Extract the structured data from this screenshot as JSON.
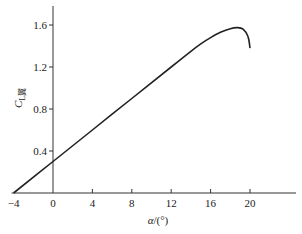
{
  "chart_data": {
    "type": "line",
    "title": "",
    "xlabel": "α/(°)",
    "ylabel": "C_L翼",
    "ylabel_parts": {
      "main": "C",
      "sub": "L翼"
    },
    "xlabel_parts": {
      "main": "α",
      "rest": "/(°)"
    },
    "xlim": [
      -4,
      24
    ],
    "ylim": [
      0,
      1.75
    ],
    "x_ticks": [
      -4,
      0,
      4,
      8,
      12,
      16,
      20
    ],
    "x_tick_labels": [
      "−4",
      "0",
      "4",
      "8",
      "12",
      "16",
      "20"
    ],
    "y_ticks": [
      0.4,
      0.8,
      1.2,
      1.6
    ],
    "y_tick_labels": [
      "0.4",
      "0.8",
      "1.2",
      "1.6"
    ],
    "grid": false,
    "legend": null,
    "series": [
      {
        "name": "C_L翼",
        "color": "#222222",
        "x": [
          -4,
          0,
          4,
          8,
          12,
          14,
          15,
          16,
          17,
          18,
          18.7,
          19.3,
          19.8,
          20
        ],
        "y": [
          0.0,
          0.3,
          0.6,
          0.9,
          1.2,
          1.35,
          1.42,
          1.48,
          1.53,
          1.565,
          1.575,
          1.56,
          1.49,
          1.38
        ]
      }
    ]
  }
}
